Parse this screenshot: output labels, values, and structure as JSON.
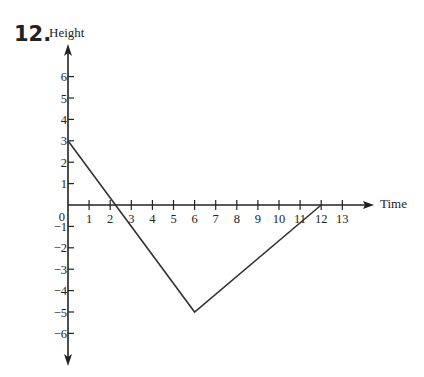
{
  "problem_number": "12.",
  "chart_data": {
    "type": "line",
    "title": "",
    "xlabel": "Time",
    "ylabel": "Height",
    "x_ticks": [
      1,
      2,
      3,
      4,
      5,
      6,
      7,
      8,
      9,
      10,
      11,
      12,
      13
    ],
    "y_ticks": [
      -6,
      -5,
      -4,
      -3,
      -2,
      -1,
      1,
      2,
      3,
      4,
      5,
      6
    ],
    "origin_label": "0",
    "xlim": [
      0,
      14.3
    ],
    "ylim": [
      -7.5,
      7.3
    ],
    "grid": false,
    "legend": null,
    "series": [
      {
        "name": "Height",
        "x": [
          0,
          6,
          12
        ],
        "y": [
          3,
          -5,
          0
        ]
      }
    ],
    "colors": {
      "axis": "#222222",
      "line": "#333333"
    }
  }
}
